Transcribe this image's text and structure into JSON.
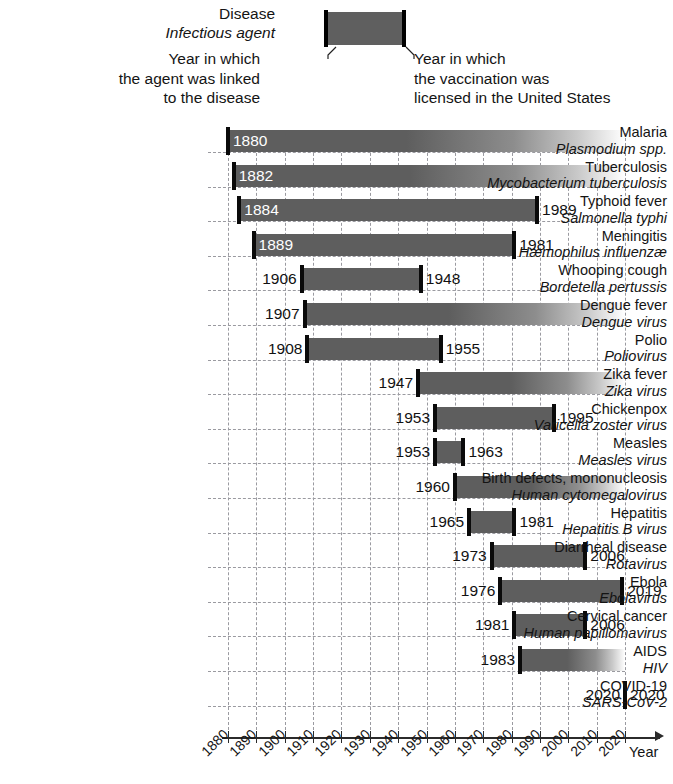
{
  "legend": {
    "disease_label": "Disease",
    "agent_label": "Infectious agent",
    "left_note_lines": [
      "Year in which",
      "the agent was linked",
      "to the disease"
    ],
    "right_note_lines": [
      "Year in which",
      "the vaccination was",
      "licensed in the United States"
    ],
    "bar_color": "#5f5f5f",
    "cap_color": "#000000"
  },
  "axis": {
    "name": "Year",
    "ticks": [
      "1880",
      "1890",
      "1900",
      "1910",
      "1920",
      "1930",
      "1940",
      "1950",
      "1960",
      "1970",
      "1980",
      "1990",
      "2000",
      "2010",
      "2020"
    ],
    "min": 1880,
    "max": 2020
  },
  "chart_data": {
    "type": "bar",
    "orientation": "horizontal",
    "title": "",
    "xlabel": "Year",
    "ylabel": "",
    "xlim": [
      1880,
      2020
    ],
    "grid": true,
    "legend_position": "top",
    "value_labels": true,
    "categories": [
      "Malaria",
      "Tuberculosis",
      "Typhoid fever",
      "Meningitis",
      "Whooping cough",
      "Dengue fever",
      "Polio",
      "Zika fever",
      "Chickenpox",
      "Measles",
      "Birth defects, mononucleosis",
      "Hepatitis",
      "Diarrheal disease",
      "Ebola",
      "Cervical cancer",
      "AIDS",
      "COVID-19"
    ],
    "rows": [
      {
        "disease": "Malaria",
        "agent": "Plasmodium spp.",
        "start": 1880,
        "end": null,
        "start_label": "1880",
        "end_label": "",
        "label_inside": true,
        "open_ended": true
      },
      {
        "disease": "Tuberculosis",
        "agent": "Mycobacterium tuberculosis",
        "start": 1882,
        "end": null,
        "start_label": "1882",
        "end_label": "",
        "label_inside": true,
        "open_ended": true
      },
      {
        "disease": "Typhoid fever",
        "agent": "Salmonella typhi",
        "start": 1884,
        "end": 1989,
        "start_label": "1884",
        "end_label": "1989",
        "label_inside": true,
        "open_ended": false
      },
      {
        "disease": "Meningitis",
        "agent": "Hæmophilus influenzæ",
        "start": 1889,
        "end": 1981,
        "start_label": "1889",
        "end_label": "1981",
        "label_inside": true,
        "open_ended": false
      },
      {
        "disease": "Whooping cough",
        "agent": "Bordetella pertussis",
        "start": 1906,
        "end": 1948,
        "start_label": "1906",
        "end_label": "1948",
        "label_inside": false,
        "open_ended": false
      },
      {
        "disease": "Dengue fever",
        "agent": "Dengue virus",
        "start": 1907,
        "end": null,
        "start_label": "1907",
        "end_label": "",
        "label_inside": false,
        "open_ended": true
      },
      {
        "disease": "Polio",
        "agent": "Poliovirus",
        "start": 1908,
        "end": 1955,
        "start_label": "1908",
        "end_label": "1955",
        "label_inside": false,
        "open_ended": false
      },
      {
        "disease": "Zika fever",
        "agent": "Zika virus",
        "start": 1947,
        "end": null,
        "start_label": "1947",
        "end_label": "",
        "label_inside": false,
        "open_ended": true
      },
      {
        "disease": "Chickenpox",
        "agent": "Varicella zoster virus",
        "start": 1953,
        "end": 1995,
        "start_label": "1953",
        "end_label": "1995",
        "label_inside": false,
        "open_ended": false
      },
      {
        "disease": "Measles",
        "agent": "Measles virus",
        "start": 1953,
        "end": 1963,
        "start_label": "1953",
        "end_label": "1963",
        "label_inside": false,
        "open_ended": false
      },
      {
        "disease": "Birth defects, mononucleosis",
        "agent": "Human cytomegalovirus",
        "start": 1960,
        "end": null,
        "start_label": "1960",
        "end_label": "",
        "label_inside": false,
        "open_ended": true
      },
      {
        "disease": "Hepatitis",
        "agent": "Hepatitis B virus",
        "start": 1965,
        "end": 1981,
        "start_label": "1965",
        "end_label": "1981",
        "label_inside": false,
        "open_ended": false
      },
      {
        "disease": "Diarrheal disease",
        "agent": "Rotavirus",
        "start": 1973,
        "end": 2006,
        "start_label": "1973",
        "end_label": "2006",
        "label_inside": false,
        "open_ended": false
      },
      {
        "disease": "Ebola",
        "agent": "Ebolavirus",
        "start": 1976,
        "end": 2019,
        "start_label": "1976",
        "end_label": "2019",
        "label_inside": false,
        "open_ended": false
      },
      {
        "disease": "Cervical cancer",
        "agent": "Human papillomavirus",
        "start": 1981,
        "end": 2006,
        "start_label": "1981",
        "end_label": "2006",
        "label_inside": false,
        "open_ended": false
      },
      {
        "disease": "AIDS",
        "agent": "HIV",
        "start": 1983,
        "end": null,
        "start_label": "1983",
        "end_label": "",
        "label_inside": false,
        "open_ended": true
      },
      {
        "disease": "COVID-19",
        "agent": "SARS-CoV-2",
        "start": 2020,
        "end": 2020,
        "start_label": "2020",
        "end_label": "2020",
        "label_inside": false,
        "open_ended": false
      }
    ]
  }
}
